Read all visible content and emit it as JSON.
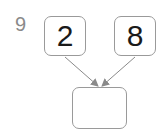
{
  "problem": {
    "number": "9",
    "left_value": "2",
    "right_value": "8",
    "result_value": ""
  },
  "colors": {
    "border": "#9a9a9a",
    "arrow": "#8a8a8a",
    "number_label": "#8a8a8a",
    "digit": "#1a1a1a"
  }
}
